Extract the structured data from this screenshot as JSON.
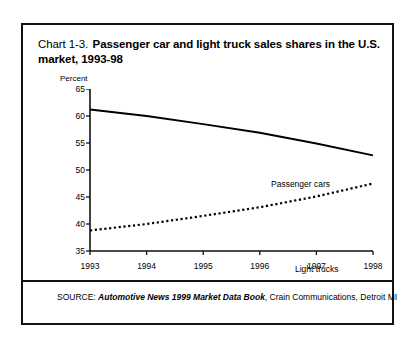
{
  "figure": {
    "title_prefix": "Chart 1-3.",
    "title_main": "Passenger car and light truck sales shares in the U.S. market, 1993-98",
    "source_prefix": "SOURCE:",
    "source_italic": "Automotive News 1999 Market Data Book",
    "source_suffix": ", Crain Communications, Detroit MI",
    "border_color": "#111111"
  },
  "chart_data": {
    "type": "line",
    "title": "Chart 1-3. Passenger car and light truck sales shares in the U.S. market, 1993-98",
    "xlabel": "",
    "ylabel": "Percent",
    "categories": [
      "1993",
      "1994",
      "1995",
      "1996",
      "1997",
      "1998"
    ],
    "x": [
      1993,
      1994,
      1995,
      1996,
      1997,
      1998
    ],
    "xlim": [
      1993,
      1998
    ],
    "ylim": [
      35,
      65
    ],
    "yticks": [
      35,
      40,
      45,
      50,
      55,
      60,
      65
    ],
    "ytick_labels": [
      "35",
      "40",
      "45",
      "50",
      "55",
      "60",
      "65"
    ],
    "xtick_labels": [
      "1993",
      "1994",
      "1995",
      "1996",
      "1997",
      "1998"
    ],
    "grid": false,
    "legend": "inline-annotations",
    "series": [
      {
        "name": "Passenger cars",
        "style": "solid",
        "color": "#000000",
        "values": [
          61.2,
          60.0,
          58.5,
          56.9,
          54.9,
          52.7
        ]
      },
      {
        "name": "Light trucks",
        "style": "dotted",
        "color": "#000000",
        "values": [
          38.8,
          40.0,
          41.5,
          43.1,
          45.1,
          47.5
        ]
      }
    ],
    "annotations": [
      {
        "text": "Passenger cars",
        "series": "Passenger cars"
      },
      {
        "text": "Light trucks",
        "series": "Light trucks"
      }
    ]
  }
}
